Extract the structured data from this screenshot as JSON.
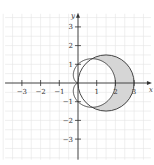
{
  "figure": {
    "x_axis_label": "x",
    "y_axis_label": "y",
    "x_ticks": [
      {
        "value": -3,
        "label": "−3"
      },
      {
        "value": -2,
        "label": "−2"
      },
      {
        "value": -1,
        "label": "−1"
      },
      {
        "value": 1,
        "label": "1"
      },
      {
        "value": 2,
        "label": "2"
      },
      {
        "value": 3,
        "label": "3"
      }
    ],
    "y_ticks": [
      {
        "value": 3,
        "label": "3"
      },
      {
        "value": 2,
        "label": "2"
      },
      {
        "value": 1,
        "label": "1"
      },
      {
        "value": -1,
        "label": "−1"
      },
      {
        "value": -2,
        "label": "−2"
      },
      {
        "value": -3,
        "label": "−3"
      }
    ],
    "xlim": [
      -3.9,
      3.9
    ],
    "ylim": [
      -4.1,
      3.7
    ],
    "grid_step": 0.5,
    "curves": [
      {
        "name": "circle",
        "equation": "r = 3cos(theta)",
        "center": [
          1.5,
          0
        ],
        "radius": 1.5
      },
      {
        "name": "cardioid",
        "equation": "r = 1 + cos(theta)"
      }
    ],
    "shaded_region": "inside circle, outside cardioid",
    "colors": {
      "shade": "#d6d6d6",
      "curve": "#333333",
      "axis": "#333333",
      "grid": "#e4e4e4"
    }
  }
}
